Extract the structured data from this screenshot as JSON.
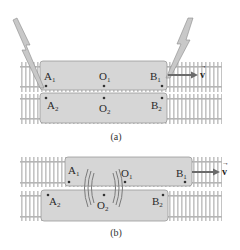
{
  "figure": {
    "panels": [
      {
        "caption": "(a)",
        "train1": {
          "points": [
            {
              "letter": "A",
              "sub": "1"
            },
            {
              "letter": "O",
              "sub": "1"
            },
            {
              "letter": "B",
              "sub": "1"
            }
          ]
        },
        "train2": {
          "points": [
            {
              "letter": "A",
              "sub": "2"
            },
            {
              "letter": "O",
              "sub": "2"
            },
            {
              "letter": "B",
              "sub": "2"
            }
          ]
        },
        "velocity_label": "v",
        "lightning": true
      },
      {
        "caption": "(b)",
        "train1": {
          "points": [
            {
              "letter": "A",
              "sub": "1"
            },
            {
              "letter": "O",
              "sub": "1"
            },
            {
              "letter": "B",
              "sub": "1"
            }
          ]
        },
        "train2": {
          "points": [
            {
              "letter": "A",
              "sub": "2"
            },
            {
              "letter": "O",
              "sub": "2"
            },
            {
              "letter": "B",
              "sub": "2"
            }
          ]
        },
        "velocity_label": "v",
        "light_waves": true
      }
    ],
    "colors": {
      "train_fill": "#d6d6d6",
      "train_stroke": "#9a9a9a",
      "track": "#bdbdbd",
      "arrow": "#6a6a6a",
      "lightning_fill": "#c8c8c8",
      "lightning_stroke": "#8a8a8a",
      "wave": "#7a7a7a"
    }
  }
}
